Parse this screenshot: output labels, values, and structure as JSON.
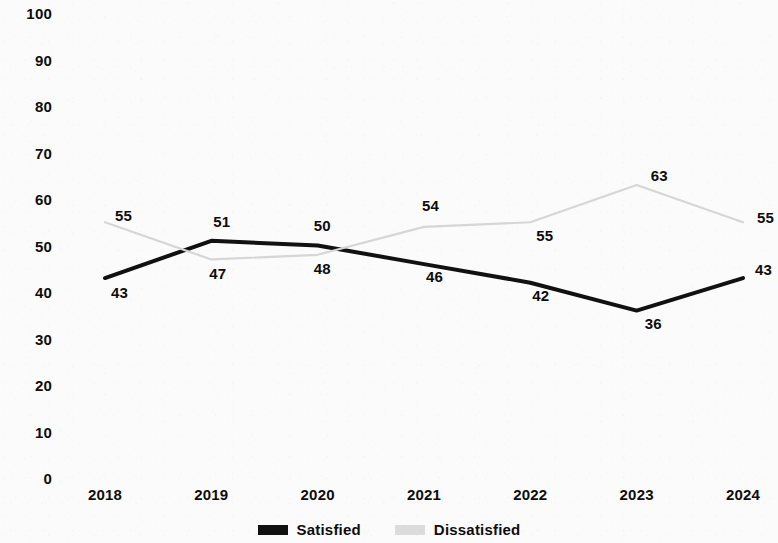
{
  "chart_data": {
    "type": "line",
    "title": "",
    "subtitle": "",
    "xlabel": "",
    "ylabel": "",
    "categories": [
      "2018",
      "2019",
      "2020",
      "2021",
      "2022",
      "2023",
      "2024"
    ],
    "ylim": [
      0,
      100
    ],
    "yticks": [
      "0",
      "10",
      "20",
      "30",
      "40",
      "50",
      "60",
      "70",
      "80",
      "90",
      "100"
    ],
    "grid": false,
    "legend_position": "bottom-center",
    "series": [
      {
        "name": "Satisfied",
        "color": "#111111",
        "values": [
          43,
          51,
          50,
          46,
          42,
          36,
          43
        ],
        "labels": [
          "43",
          "51",
          "50",
          "46",
          "42",
          "36",
          "43"
        ],
        "label_offsets": [
          {
            "dx": 6,
            "dy": 14
          },
          {
            "dx": 2,
            "dy": -20
          },
          {
            "dx": -4,
            "dy": -21
          },
          {
            "dx": 2,
            "dy": 12
          },
          {
            "dx": 2,
            "dy": 12
          },
          {
            "dx": 8,
            "dy": 12
          },
          {
            "dx": 12,
            "dy": -9
          }
        ]
      },
      {
        "name": "Dissatisfied",
        "color": "#d6d6d6",
        "values": [
          55,
          47,
          48,
          54,
          55,
          63,
          55
        ],
        "labels": [
          "55",
          "47",
          "48",
          "54",
          "55",
          "63",
          "55"
        ],
        "label_offsets": [
          {
            "dx": 10,
            "dy": -7
          },
          {
            "dx": -2,
            "dy": 14
          },
          {
            "dx": -4,
            "dy": 13
          },
          {
            "dx": -2,
            "dy": -22
          },
          {
            "dx": 6,
            "dy": 13
          },
          {
            "dx": 14,
            "dy": -10
          },
          {
            "dx": 14,
            "dy": -5
          }
        ]
      }
    ]
  },
  "legend": {
    "items": [
      {
        "label": "Satisfied",
        "color": "#111111"
      },
      {
        "label": "Dissatisfied",
        "color": "#dcdcdc"
      }
    ]
  }
}
